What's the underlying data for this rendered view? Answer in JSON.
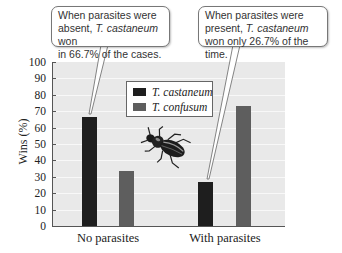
{
  "chart_data": {
    "type": "bar",
    "title": "",
    "xlabel": "",
    "ylabel": "Wins (%)",
    "ylim": [
      0,
      100
    ],
    "yticks": [
      0,
      10,
      20,
      30,
      40,
      50,
      60,
      70,
      80,
      90,
      100
    ],
    "grid": true,
    "legend_position": "upper center (inside plot)",
    "categories": [
      "No parasites",
      "With parasites"
    ],
    "series": [
      {
        "name": "T. castaneum",
        "color": "#1e1e1e",
        "values": [
          66.7,
          26.7
        ]
      },
      {
        "name": "T. confusum",
        "color": "#5e5e5e",
        "values": [
          33.3,
          73.3
        ]
      }
    ],
    "annotations": [
      {
        "target": "No parasites / T. castaneum",
        "text_parts": [
          "When parasites were absent, ",
          "T. castaneum",
          " won in 66.7% of the cases."
        ]
      },
      {
        "target": "With parasites / T. castaneum",
        "text_parts": [
          "When parasites were present, ",
          "T. castaneum",
          " won only 26.7% of the time."
        ]
      }
    ]
  },
  "labels": {
    "ylabel": "Wins (%)",
    "yticks": [
      "0",
      "10",
      "20",
      "30",
      "40",
      "50",
      "60",
      "70",
      "80",
      "90",
      "100"
    ],
    "categories": [
      "No parasites",
      "With parasites"
    ],
    "legend": [
      "T. castaneum",
      "T. confusum"
    ]
  },
  "callouts": {
    "left": {
      "line1": "When parasites were",
      "line2_pre": "absent, ",
      "line2_italic": "T. castaneum",
      "line2_post": " won",
      "line3": "in 66.7% of the cases."
    },
    "right": {
      "line1": "When parasites were",
      "line2_pre": "present, ",
      "line2_italic": "T. castaneum",
      "line3": "won only 26.7% of the time."
    }
  },
  "illustration": {
    "icon": "beetle-icon"
  }
}
